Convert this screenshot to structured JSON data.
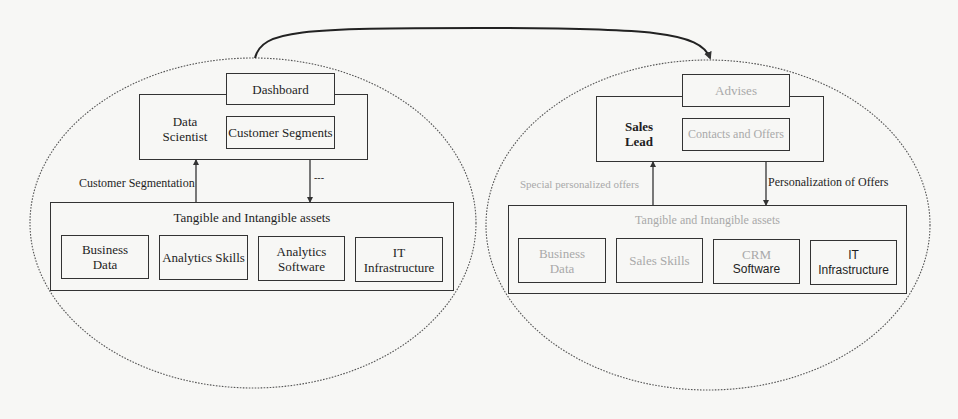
{
  "diagram": {
    "connector": {
      "from": "left-actor-cluster",
      "to": "right-actor-cluster",
      "style": "curved-arrow"
    },
    "left": {
      "actor_label": "Data Scientist",
      "actor_line1": "Data",
      "actor_line2": "Scientist",
      "output_top": "Dashboard",
      "output_inner": "Customer Segments",
      "up_arrow_label": "Customer Segmentation",
      "down_arrow_label": "---",
      "assets_title": "Tangible and Intangible assets",
      "assets": [
        {
          "line1": "Business",
          "line2": "Data"
        },
        {
          "line1": "Analytics Skills",
          "line2": ""
        },
        {
          "line1": "Analytics",
          "line2": "Software"
        },
        {
          "line1": "IT",
          "line2": "Infrastructure"
        }
      ]
    },
    "right": {
      "actor_line1": "Sales",
      "actor_line2": "Lead",
      "output_top": "Advises",
      "output_inner": "Contacts and Offers",
      "up_arrow_label": "Special personalized offers",
      "down_arrow_label": "Personalization of Offers",
      "assets_title": "Tangible and Intangible assets",
      "assets": [
        {
          "line1": "Business",
          "line2": "Data"
        },
        {
          "line1": "Sales Skills",
          "line2": ""
        },
        {
          "line1": "CRM",
          "line2": "Software"
        },
        {
          "line1": "IT",
          "line2": "Infrastructure"
        }
      ]
    }
  },
  "colors": {
    "background": "#f7f7f5",
    "line": "#333333",
    "faded_text": "#a9a9a9"
  }
}
